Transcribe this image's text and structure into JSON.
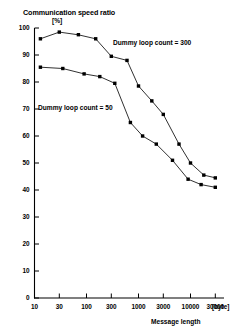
{
  "chart_title": "Communication speed ratio",
  "y_axis_unit": "[%]",
  "x_axis_title": "Message length",
  "x_axis_unit": "[byte]",
  "series_labels": {
    "upper": "Dummy loop count = 300",
    "lower": "Dummy loop count = 50"
  },
  "axes": {
    "y_ticks": [
      "0",
      "10",
      "20",
      "30",
      "40",
      "50",
      "60",
      "70",
      "80",
      "90",
      "100"
    ],
    "x_ticks": [
      "10",
      "30",
      "100",
      "300",
      "1000",
      "3000",
      "10000",
      "30000"
    ]
  },
  "colors": {
    "axis": "#000000",
    "line": "#1a1a1a",
    "marker": "#000000",
    "background": "#ffffff"
  },
  "chart_data": {
    "type": "line",
    "title": "Communication speed ratio",
    "xlabel": "Message length [byte]",
    "ylabel": "Communication speed ratio [%]",
    "xscale": "log",
    "x": [
      10,
      30,
      100,
      300,
      1000,
      3000,
      10000,
      30000
    ],
    "x_tick_labels": [
      "10",
      "30",
      "100",
      "300",
      "1000",
      "3000",
      "10000",
      "30000"
    ],
    "ylim": [
      0,
      100
    ],
    "y_ticks": [
      0,
      10,
      20,
      30,
      40,
      50,
      60,
      70,
      80,
      90,
      100
    ],
    "grid": false,
    "legend_position": "inline-annotation",
    "series": [
      {
        "name": "Dummy loop count = 300",
        "x": [
          13,
          30,
          70,
          150,
          300,
          600,
          1000,
          1800,
          3000,
          6000,
          10000,
          18000,
          30000
        ],
        "values": [
          96.0,
          98.5,
          97.5,
          96.0,
          89.5,
          88.0,
          78.5,
          73.0,
          68.0,
          57.0,
          50.0,
          45.5,
          44.5
        ]
      },
      {
        "name": "Dummy loop count = 50",
        "x": [
          13,
          35,
          90,
          180,
          350,
          700,
          1200,
          2200,
          4500,
          9000,
          16000,
          30000
        ],
        "values": [
          85.5,
          85.0,
          83.0,
          82.0,
          79.5,
          65.0,
          60.0,
          57.0,
          51.0,
          44.0,
          42.0,
          41.0
        ]
      }
    ]
  }
}
